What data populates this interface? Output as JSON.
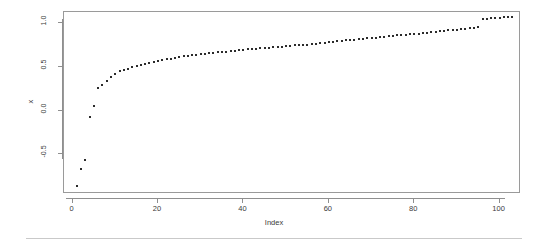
{
  "chart_data": {
    "type": "scatter",
    "title": "",
    "subtitle": "",
    "xlabel": "Index",
    "ylabel": "x",
    "xlim": [
      -2,
      105
    ],
    "ylim": [
      -0.95,
      1.12
    ],
    "grid": false,
    "legend": null,
    "xticks": [
      0,
      20,
      40,
      60,
      80,
      100
    ],
    "xtick_labels": [
      "0",
      "20",
      "40",
      "60",
      "80",
      "100"
    ],
    "yticks": [
      -0.5,
      0.0,
      0.5,
      1.0
    ],
    "ytick_labels": [
      "-0.5",
      "0.0",
      "0.5",
      "1.0"
    ],
    "point_color": "#2b2b2b",
    "point_marker": "square",
    "point_size_px": 2,
    "box_color": "#9a9a9a",
    "n_points": 103,
    "x": [
      1,
      2,
      3,
      4,
      5,
      6,
      7,
      8,
      9,
      10,
      11,
      12,
      13,
      14,
      15,
      16,
      17,
      18,
      19,
      20,
      21,
      22,
      23,
      24,
      25,
      26,
      27,
      28,
      29,
      30,
      31,
      32,
      33,
      34,
      35,
      36,
      37,
      38,
      39,
      40,
      41,
      42,
      43,
      44,
      45,
      46,
      47,
      48,
      49,
      50,
      51,
      52,
      53,
      54,
      55,
      56,
      57,
      58,
      59,
      60,
      61,
      62,
      63,
      64,
      65,
      66,
      67,
      68,
      69,
      70,
      71,
      72,
      73,
      74,
      75,
      76,
      77,
      78,
      79,
      80,
      81,
      82,
      83,
      84,
      85,
      86,
      87,
      88,
      89,
      90,
      91,
      92,
      93,
      94,
      95,
      96,
      97,
      98,
      99,
      100,
      101,
      102,
      103
    ],
    "y": [
      -0.86,
      -0.66,
      -0.56,
      -0.07,
      0.05,
      0.26,
      0.29,
      0.34,
      0.38,
      0.42,
      0.45,
      0.46,
      0.47,
      0.5,
      0.51,
      0.52,
      0.53,
      0.54,
      0.55,
      0.56,
      0.57,
      0.58,
      0.59,
      0.6,
      0.61,
      0.615,
      0.62,
      0.63,
      0.635,
      0.64,
      0.645,
      0.65,
      0.655,
      0.66,
      0.665,
      0.67,
      0.675,
      0.68,
      0.685,
      0.69,
      0.695,
      0.7,
      0.7,
      0.705,
      0.71,
      0.715,
      0.72,
      0.72,
      0.725,
      0.73,
      0.735,
      0.74,
      0.74,
      0.745,
      0.75,
      0.755,
      0.76,
      0.765,
      0.77,
      0.775,
      0.78,
      0.785,
      0.79,
      0.8,
      0.8,
      0.805,
      0.81,
      0.815,
      0.82,
      0.825,
      0.83,
      0.835,
      0.84,
      0.845,
      0.85,
      0.855,
      0.86,
      0.86,
      0.865,
      0.87,
      0.875,
      0.88,
      0.885,
      0.89,
      0.895,
      0.9,
      0.905,
      0.91,
      0.915,
      0.92,
      0.925,
      0.93,
      0.935,
      0.94,
      0.945,
      1.04,
      1.045,
      1.05,
      1.05,
      1.055,
      1.06,
      1.06,
      1.065
    ]
  },
  "axis": {
    "y_title": "x",
    "x_title": "Index"
  }
}
